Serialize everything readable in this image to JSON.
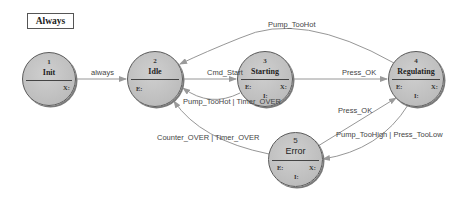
{
  "legend_box": {
    "label": "Always"
  },
  "states": [
    {
      "id": "1",
      "name": "Init",
      "tags": [
        "X:"
      ]
    },
    {
      "id": "2",
      "name": "Idle",
      "tags": [
        "E:"
      ]
    },
    {
      "id": "3",
      "name": "Starting",
      "tags": [
        "E:",
        "I:",
        "X:"
      ]
    },
    {
      "id": "4",
      "name": "Regulating",
      "tags": [
        "E:",
        "I:",
        "X:"
      ]
    },
    {
      "id": "5",
      "name": "Error",
      "tags": [
        "E:",
        "I:",
        "X:"
      ]
    }
  ],
  "transitions": [
    {
      "from": "1",
      "to": "2",
      "label": "always"
    },
    {
      "from": "2",
      "to": "3",
      "label": "Cmd_Start"
    },
    {
      "from": "3",
      "to": "2",
      "label": "Pump_TooHot | Timer_OVER"
    },
    {
      "from": "3",
      "to": "4",
      "label": "Press_OK"
    },
    {
      "from": "4",
      "to": "2",
      "label": "Pump_TooHot"
    },
    {
      "from": "5",
      "to": "4",
      "label": "Press_OK"
    },
    {
      "from": "4",
      "to": "5",
      "label": "Pump_TooHigh | Press_TooLow"
    },
    {
      "from": "5",
      "to": "2",
      "label": "Counter_OVER | Timer_OVER"
    }
  ],
  "colors": {
    "state_fill": "#bdbdbd",
    "state_border": "#5a5a5a",
    "edge": "#8a8a8a",
    "text": "#444444"
  }
}
